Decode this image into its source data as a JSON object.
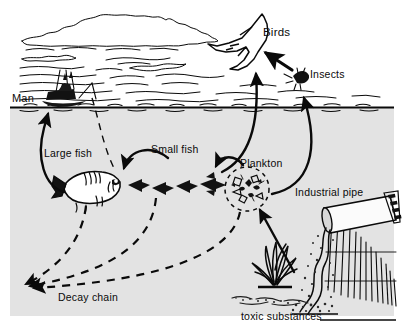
{
  "diagram": {
    "style": "hand-drawn black ink line illustration",
    "colors": {
      "ink": "#0a0a0a",
      "paper": "#ffffff",
      "water": "#e3e3e3",
      "pipe_body": "#fbfbfb",
      "sediment": "#2b2b2b"
    },
    "labels": {
      "birds": "Birds",
      "insects": "Insects",
      "man": "Man",
      "large_fish": "Large fish",
      "small_fish": "Small fish",
      "plankton": "Plankton",
      "industrial_pipe": "Industrial pipe",
      "decay_chain": "Decay chain",
      "toxic_substances": "toxic substances"
    },
    "icons": {
      "bird": "flying-bird-icon",
      "insect": "insect-icon",
      "boat": "fishing-boat-icon",
      "large_fish": "large-fish-icon",
      "small_fish": "small-fish-icon",
      "plankton": "plankton-cluster-icon",
      "seaweed": "seaweed-plant-icon",
      "pipe": "industrial-pipe-icon",
      "clouds": "cloud-icon",
      "waterline": "water-surface-icon",
      "sediment": "toxic-sediment-icon",
      "shore": "hatched-shore-icon"
    },
    "nodes": [
      {
        "id": "man",
        "label": "Man",
        "zone": "surface"
      },
      {
        "id": "birds",
        "label": "Birds",
        "zone": "air"
      },
      {
        "id": "insects",
        "label": "Insects",
        "zone": "air"
      },
      {
        "id": "large_fish",
        "label": "Large fish",
        "zone": "water"
      },
      {
        "id": "small_fish",
        "label": "Small fish",
        "zone": "water"
      },
      {
        "id": "plankton",
        "label": "Plankton",
        "zone": "water"
      },
      {
        "id": "seaweed",
        "label": "",
        "zone": "water"
      },
      {
        "id": "pipe",
        "label": "Industrial pipe",
        "zone": "shore"
      },
      {
        "id": "toxic",
        "label": "toxic substances",
        "zone": "sediment"
      },
      {
        "id": "decay",
        "label": "Decay chain",
        "zone": "water"
      }
    ],
    "flows": [
      {
        "from": "toxic",
        "to": "plankton",
        "kind": "solid",
        "arrow": true
      },
      {
        "from": "plankton",
        "to": "small_fish",
        "kind": "solid",
        "arrow": true
      },
      {
        "from": "small_fish",
        "to": "large_fish",
        "kind": "solid",
        "arrow": true
      },
      {
        "from": "large_fish",
        "to": "man",
        "kind": "solid",
        "arrow": true
      },
      {
        "from": "plankton",
        "to": "insects",
        "kind": "solid",
        "arrow": true
      },
      {
        "from": "small_fish",
        "to": "birds",
        "kind": "solid",
        "arrow": true
      },
      {
        "from": "insects",
        "to": "birds",
        "kind": "solid",
        "arrow": true
      },
      {
        "from": "large_fish",
        "to": "decay",
        "kind": "dashed",
        "arrow": true
      },
      {
        "from": "small_fish",
        "to": "decay",
        "kind": "dashed",
        "arrow": true
      },
      {
        "from": "plankton",
        "to": "decay",
        "kind": "dashed",
        "arrow": true
      },
      {
        "from": "man",
        "to": "large_fish",
        "kind": "dashed",
        "arrow": false
      }
    ],
    "counts": {
      "small_fish": 4,
      "birds": 1,
      "insects": 1,
      "boats": 1
    }
  }
}
